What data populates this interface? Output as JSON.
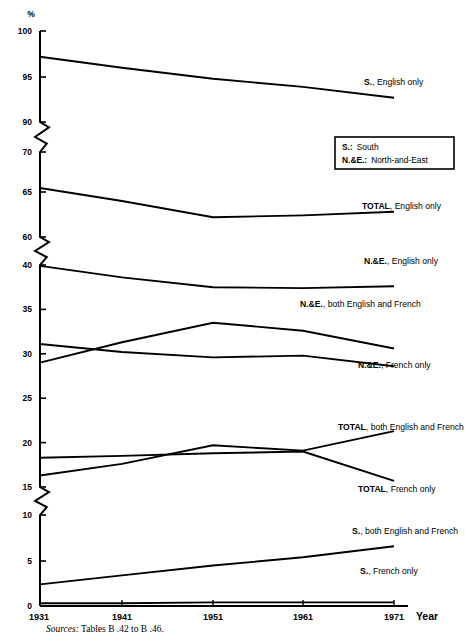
{
  "chart_data": {
    "type": "line",
    "title": "",
    "ylabel": "%",
    "xlabel": "Year",
    "x": [
      1931,
      1941,
      1951,
      1961,
      1971
    ],
    "yticks": [
      0,
      5,
      10,
      15,
      40,
      60,
      65,
      70,
      90,
      95,
      100
    ],
    "ytick_labels": [
      "0",
      "5",
      "10",
      "15",
      "10",
      "15",
      "20",
      "25",
      "30",
      "35",
      "40",
      "60",
      "65",
      "70",
      "90",
      "95",
      "100"
    ],
    "axis_breaks": [
      [
        15,
        40
      ],
      [
        60,
        70
      ],
      [
        70,
        90
      ]
    ],
    "grid": false,
    "legend_position": "inline-labels",
    "series": [
      {
        "name": "S., English only",
        "values": [
          97.2,
          96.0,
          94.8,
          93.9,
          92.7
        ]
      },
      {
        "name": "TOTAL, English only",
        "values": [
          65.5,
          64.0,
          62.2,
          62.4,
          62.8
        ]
      },
      {
        "name": "N.&E., English only",
        "values": [
          39.9,
          38.6,
          37.5,
          37.4,
          37.6
        ]
      },
      {
        "name": "N.&E., both English and French",
        "values": [
          29.0,
          31.3,
          33.5,
          32.6,
          30.6
        ]
      },
      {
        "name": "N.&E., French only",
        "values": [
          31.1,
          30.2,
          29.6,
          29.8,
          28.6
        ]
      },
      {
        "name": "TOTAL, both English and French",
        "values": [
          16.3,
          17.6,
          19.7,
          19.1,
          21.3
        ]
      },
      {
        "name": "TOTAL, French only",
        "values": [
          18.3,
          18.5,
          18.8,
          19.0,
          15.7
        ]
      },
      {
        "name": "S., both English and French",
        "values": [
          2.4,
          3.4,
          4.5,
          5.4,
          6.6
        ]
      },
      {
        "name": "S., French only",
        "values": [
          0.3,
          0.3,
          0.4,
          0.4,
          0.4
        ]
      }
    ],
    "series_labels": [
      {
        "text_bold": "S.",
        "text_rest": ", English only"
      },
      {
        "text_bold": "TOTAL",
        "text_rest": ", English only"
      },
      {
        "text_bold": "N.&E.",
        "text_rest": ", English only"
      },
      {
        "text_bold": "N.&E.",
        "text_rest": ", both English and French"
      },
      {
        "text_bold": "N.&E.",
        "text_rest": ", French only"
      },
      {
        "text_bold": "TOTAL",
        "text_rest": ", both English and French"
      },
      {
        "text_bold": "TOTAL",
        "text_rest": ", French only"
      },
      {
        "text_bold": "S.",
        "text_rest": ", both English and French"
      },
      {
        "text_bold": "S.",
        "text_rest": ", French only"
      }
    ]
  },
  "axis": {
    "unit_label": "%",
    "year_label": "Year",
    "x_tick_labels": [
      "1931",
      "1941",
      "1951",
      "1961",
      "1971"
    ],
    "y_tick_labels": [
      "100",
      "95",
      "90",
      "70",
      "65",
      "60",
      "40",
      "35",
      "30",
      "25",
      "20",
      "15",
      "10",
      "5",
      "0"
    ]
  },
  "legend_box": {
    "rows": [
      {
        "key": "S.:",
        "value": "South"
      },
      {
        "key": "N.&E.:",
        "value": "North-and-East"
      }
    ]
  },
  "footnote": {
    "prefix": "Sources:",
    "text": "Tables B .42 to B .46."
  },
  "colors": {
    "line": "#000000",
    "background": "#ffffff",
    "text": "#000000"
  }
}
